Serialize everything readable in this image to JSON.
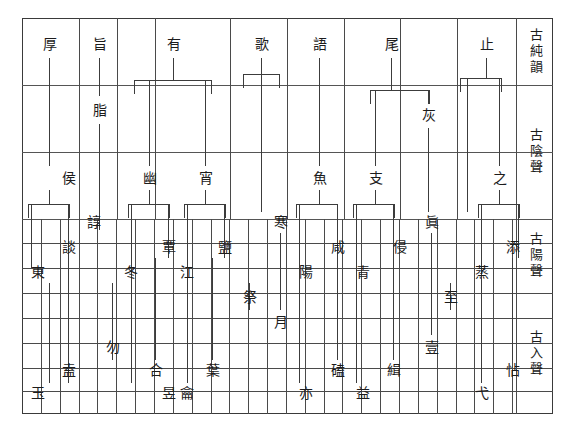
{
  "figure": {
    "type": "diagram",
    "grid": {
      "left": 22,
      "right": 553,
      "top": 18,
      "bottom": 414,
      "legend_divider_x": 516,
      "col_width": 18.85,
      "row_lines_y": [
        18,
        85,
        152,
        219,
        243,
        268,
        293,
        318,
        343,
        368,
        391,
        414
      ]
    }
  },
  "legend": {
    "cells": [
      {
        "label": "古純韻",
        "top": 18,
        "bottom": 85
      },
      {
        "label": "古陰聲",
        "top": 85,
        "bottom": 219
      },
      {
        "label": "古陽聲",
        "top": 219,
        "bottom": 293
      },
      {
        "label": "古入聲",
        "top": 293,
        "bottom": 414
      }
    ]
  },
  "rows": {
    "r_pure": {
      "label": "古純韻",
      "y": 44
    },
    "r_yin_a": {
      "label": "古陰聲",
      "y": 110
    },
    "r_yin_b": {
      "label": "古陰聲",
      "y": 178
    },
    "r_yang_1": {
      "y": 222
    },
    "r_yang_2": {
      "y": 247
    },
    "r_yang_3": {
      "y": 272
    },
    "r_ru_1": {
      "y": 297
    },
    "r_ru_2": {
      "y": 322
    },
    "r_ru_3": {
      "y": 347
    },
    "r_ru_4": {
      "y": 370
    },
    "r_ru_5": {
      "y": 393
    }
  },
  "characters": [
    {
      "id": "c01",
      "text": "厚",
      "x": 40,
      "y": 44
    },
    {
      "id": "c02",
      "text": "旨",
      "x": 90,
      "y": 44
    },
    {
      "id": "c03",
      "text": "有",
      "x": 164,
      "y": 44
    },
    {
      "id": "c04",
      "text": "歌",
      "x": 252,
      "y": 44
    },
    {
      "id": "c05",
      "text": "語",
      "x": 310,
      "y": 44
    },
    {
      "id": "c06",
      "text": "尾",
      "x": 382,
      "y": 44
    },
    {
      "id": "c07",
      "text": "止",
      "x": 477,
      "y": 44
    },
    {
      "id": "c08",
      "text": "脂",
      "x": 90,
      "y": 110
    },
    {
      "id": "c09",
      "text": "灰",
      "x": 419,
      "y": 115
    },
    {
      "id": "c10",
      "text": "侯",
      "x": 59,
      "y": 178
    },
    {
      "id": "c11",
      "text": "幽",
      "x": 140,
      "y": 178
    },
    {
      "id": "c12",
      "text": "宵",
      "x": 196,
      "y": 178
    },
    {
      "id": "c13",
      "text": "魚",
      "x": 310,
      "y": 178
    },
    {
      "id": "c14",
      "text": "支",
      "x": 366,
      "y": 178
    },
    {
      "id": "c15",
      "text": "之",
      "x": 490,
      "y": 178
    },
    {
      "id": "c16",
      "text": "諄",
      "x": 84,
      "y": 222
    },
    {
      "id": "c17",
      "text": "寒",
      "x": 271,
      "y": 222
    },
    {
      "id": "c18",
      "text": "眞",
      "x": 422,
      "y": 222
    },
    {
      "id": "c19",
      "text": "談",
      "x": 59,
      "y": 247
    },
    {
      "id": "c20",
      "text": "覃",
      "x": 159,
      "y": 247
    },
    {
      "id": "c21",
      "text": "鹽",
      "x": 215,
      "y": 247
    },
    {
      "id": "c22",
      "text": "咸",
      "x": 328,
      "y": 247
    },
    {
      "id": "c23",
      "text": "侵",
      "x": 390,
      "y": 247
    },
    {
      "id": "c24",
      "text": "添",
      "x": 503,
      "y": 247
    },
    {
      "id": "c25",
      "text": "東",
      "x": 28,
      "y": 272
    },
    {
      "id": "c26",
      "text": "冬",
      "x": 121,
      "y": 272
    },
    {
      "id": "c27",
      "text": "江",
      "x": 177,
      "y": 272
    },
    {
      "id": "c28",
      "text": "陽",
      "x": 296,
      "y": 272
    },
    {
      "id": "c29",
      "text": "青",
      "x": 353,
      "y": 272
    },
    {
      "id": "c30",
      "text": "蒸",
      "x": 472,
      "y": 272
    },
    {
      "id": "c31",
      "text": "祭",
      "x": 240,
      "y": 297
    },
    {
      "id": "c32",
      "text": "至",
      "x": 441,
      "y": 297
    },
    {
      "id": "c33",
      "text": "月",
      "x": 271,
      "y": 322
    },
    {
      "id": "c34",
      "text": "勿",
      "x": 103,
      "y": 347
    },
    {
      "id": "c35",
      "text": "壹",
      "x": 422,
      "y": 347
    },
    {
      "id": "c36",
      "text": "盍",
      "x": 59,
      "y": 370
    },
    {
      "id": "c37",
      "text": "合",
      "x": 146,
      "y": 370
    },
    {
      "id": "c38",
      "text": "葉",
      "x": 203,
      "y": 370
    },
    {
      "id": "c39",
      "text": "磕",
      "x": 328,
      "y": 370
    },
    {
      "id": "c40",
      "text": "緝",
      "x": 384,
      "y": 370
    },
    {
      "id": "c41",
      "text": "怗",
      "x": 503,
      "y": 370
    },
    {
      "id": "c42",
      "text": "玉",
      "x": 28,
      "y": 393
    },
    {
      "id": "c43",
      "text": "昱",
      "x": 159,
      "y": 393
    },
    {
      "id": "c44",
      "text": "龠",
      "x": 177,
      "y": 393
    },
    {
      "id": "c45",
      "text": "亦",
      "x": 296,
      "y": 393
    },
    {
      "id": "c46",
      "text": "益",
      "x": 353,
      "y": 393
    },
    {
      "id": "c47",
      "text": "弋",
      "x": 472,
      "y": 393
    }
  ],
  "connectors": {
    "stems": [
      {
        "id": "s01",
        "x": 49,
        "y1": 58,
        "y2": 166
      },
      {
        "id": "s02",
        "x": 99,
        "y1": 58,
        "y2": 96
      },
      {
        "id": "s03",
        "x": 99,
        "y1": 124,
        "y2": 230
      },
      {
        "id": "s04",
        "x": 173,
        "y1": 58,
        "y2": 80
      },
      {
        "id": "s05",
        "x": 261,
        "y1": 58,
        "y2": 74
      },
      {
        "id": "s06",
        "x": 319,
        "y1": 58,
        "y2": 166
      },
      {
        "id": "s07",
        "x": 391,
        "y1": 58,
        "y2": 90
      },
      {
        "id": "s08",
        "x": 486,
        "y1": 58,
        "y2": 78
      },
      {
        "id": "s09",
        "x": 149,
        "y1": 80,
        "y2": 166
      },
      {
        "id": "s10",
        "x": 205,
        "y1": 80,
        "y2": 166
      },
      {
        "id": "s11",
        "x": 375,
        "y1": 90,
        "y2": 166
      },
      {
        "id": "s12",
        "x": 428,
        "y1": 90,
        "y2": 104
      },
      {
        "id": "s13",
        "x": 428,
        "y1": 128,
        "y2": 212
      },
      {
        "id": "s14",
        "x": 467,
        "y1": 78,
        "y2": 212
      },
      {
        "id": "s15",
        "x": 499,
        "y1": 78,
        "y2": 166
      },
      {
        "id": "s16",
        "x": 261,
        "y1": 74,
        "y2": 212
      },
      {
        "id": "s17",
        "x": 49,
        "y1": 190,
        "y2": 204
      },
      {
        "id": "s18",
        "x": 149,
        "y1": 190,
        "y2": 204
      },
      {
        "id": "s19",
        "x": 205,
        "y1": 190,
        "y2": 204
      },
      {
        "id": "s20",
        "x": 319,
        "y1": 190,
        "y2": 204
      },
      {
        "id": "s21",
        "x": 375,
        "y1": 190,
        "y2": 204
      },
      {
        "id": "s22",
        "x": 499,
        "y1": 190,
        "y2": 204
      },
      {
        "id": "s23",
        "x": 31,
        "y1": 204,
        "y2": 268
      },
      {
        "id": "s24",
        "x": 68,
        "y1": 204,
        "y2": 258
      },
      {
        "id": "s25",
        "x": 131,
        "y1": 204,
        "y2": 283
      },
      {
        "id": "s26",
        "x": 168,
        "y1": 204,
        "y2": 258
      },
      {
        "id": "s27",
        "x": 187,
        "y1": 204,
        "y2": 283
      },
      {
        "id": "s28",
        "x": 224,
        "y1": 204,
        "y2": 258
      },
      {
        "id": "s29",
        "x": 299,
        "y1": 204,
        "y2": 283
      },
      {
        "id": "s30",
        "x": 337,
        "y1": 204,
        "y2": 258
      },
      {
        "id": "s31",
        "x": 356,
        "y1": 204,
        "y2": 283
      },
      {
        "id": "s32",
        "x": 393,
        "y1": 204,
        "y2": 258
      },
      {
        "id": "s33",
        "x": 481,
        "y1": 204,
        "y2": 283
      },
      {
        "id": "s34",
        "x": 518,
        "y1": 204,
        "y2": 258
      },
      {
        "id": "s35",
        "x": 49,
        "y1": 283,
        "y2": 383
      },
      {
        "id": "s36",
        "x": 68,
        "y1": 258,
        "y2": 383
      },
      {
        "id": "s37",
        "x": 112,
        "y1": 283,
        "y2": 360
      },
      {
        "id": "s38",
        "x": 131,
        "y1": 283,
        "y2": 383
      },
      {
        "id": "s39",
        "x": 155,
        "y1": 258,
        "y2": 360
      },
      {
        "id": "s40",
        "x": 187,
        "y1": 283,
        "y2": 383
      },
      {
        "id": "s41",
        "x": 212,
        "y1": 258,
        "y2": 360
      },
      {
        "id": "s42",
        "x": 249,
        "y1": 283,
        "y2": 310
      },
      {
        "id": "s43",
        "x": 280,
        "y1": 233,
        "y2": 310
      },
      {
        "id": "s44",
        "x": 299,
        "y1": 283,
        "y2": 383
      },
      {
        "id": "s45",
        "x": 337,
        "y1": 258,
        "y2": 360
      },
      {
        "id": "s46",
        "x": 356,
        "y1": 283,
        "y2": 383
      },
      {
        "id": "s47",
        "x": 393,
        "y1": 258,
        "y2": 360
      },
      {
        "id": "s48",
        "x": 431,
        "y1": 233,
        "y2": 335
      },
      {
        "id": "s49",
        "x": 450,
        "y1": 283,
        "y2": 310
      },
      {
        "id": "s50",
        "x": 481,
        "y1": 283,
        "y2": 383
      },
      {
        "id": "s51",
        "x": 512,
        "y1": 258,
        "y2": 360
      }
    ],
    "brackets": [
      {
        "id": "b01",
        "x": 134,
        "w": 78,
        "y": 80,
        "h": 14
      },
      {
        "id": "b02",
        "x": 243,
        "w": 37,
        "y": 74,
        "h": 14
      },
      {
        "id": "b03",
        "x": 370,
        "w": 60,
        "y": 90,
        "h": 14
      },
      {
        "id": "b04",
        "x": 460,
        "w": 42,
        "y": 78,
        "h": 14
      },
      {
        "id": "b05",
        "x": 28,
        "w": 42,
        "y": 204,
        "h": 14
      },
      {
        "id": "b06",
        "x": 128,
        "w": 42,
        "y": 204,
        "h": 14
      },
      {
        "id": "b07",
        "x": 184,
        "w": 42,
        "y": 204,
        "h": 14
      },
      {
        "id": "b08",
        "x": 296,
        "w": 42,
        "y": 204,
        "h": 14
      },
      {
        "id": "b09",
        "x": 353,
        "w": 42,
        "y": 204,
        "h": 14
      },
      {
        "id": "b10",
        "x": 478,
        "w": 42,
        "y": 204,
        "h": 14
      }
    ]
  }
}
